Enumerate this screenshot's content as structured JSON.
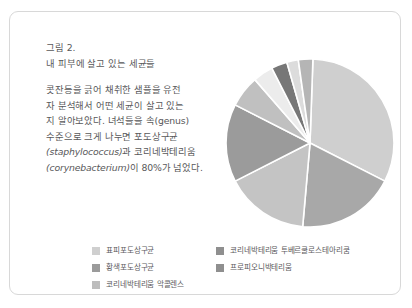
{
  "card": {
    "figure_label": "그림 2.",
    "figure_title": "내 피부에 살고 있는 세균들",
    "paragraph_lines": [
      "콧잔등을 긁어 채취한 샘플을 유전",
      "자 분석해서 어떤 세균이 살고 있는",
      "지 알아보았다. 녀석들을 속(genus)",
      "수준으로 크게 나누면 포도상구균"
    ],
    "paragraph_line5_sci": "(staphylococcus)",
    "paragraph_line5_rest": "과 코리네박테리움",
    "paragraph_line6_sci": "(corynebacterium)",
    "paragraph_line6_rest": "이 80%가 넘었다."
  },
  "chart_data": {
    "type": "pie",
    "title": "내 피부에 살고 있는 세균들",
    "legend_position": "bottom",
    "grid": false,
    "categories": [
      "표피포도상구균",
      "코리네박테리움 투베르쿨로스테아리쿰",
      "황색포도상구균",
      "프로피오니박테리움",
      "코리네박테리움 악콜렌스",
      "기타"
    ],
    "values": [
      32,
      19,
      16,
      15,
      6,
      12
    ],
    "unit": "%",
    "slices": [
      {
        "label": "표피포도상구균",
        "value": 32,
        "color": "#cfcfcf",
        "start_deg": 2,
        "end_deg": 117
      },
      {
        "label": "코리네박테리움 투베르쿨로스테아리쿰",
        "value": 19,
        "color": "#a8a8a8",
        "start_deg": 117,
        "end_deg": 185
      },
      {
        "label": "황색포도상구균",
        "value": 16,
        "color": "#c4c4c4",
        "start_deg": 185,
        "end_deg": 243
      },
      {
        "label": "프로피오니박테리움",
        "value": 15,
        "color": "#9b9b9b",
        "start_deg": 243,
        "end_deg": 297
      },
      {
        "label": "코리네박테리움 악콜렌스",
        "value": 6,
        "color": "#c0c0c0",
        "start_deg": 297,
        "end_deg": 319
      },
      {
        "label": "기타-1",
        "value": 4,
        "color": "#ececec",
        "start_deg": 319,
        "end_deg": 333
      },
      {
        "label": "기타-2",
        "value": 3,
        "color": "#777777",
        "start_deg": 333,
        "end_deg": 344
      },
      {
        "label": "기타-3",
        "value": 2,
        "color": "#dcdcdc",
        "start_deg": 344,
        "end_deg": 352
      },
      {
        "label": "기타-4",
        "value": 3,
        "color": "#b5b5b5",
        "start_deg": 352,
        "end_deg": 362
      }
    ]
  },
  "legend": {
    "left": [
      {
        "label": "표피포도상구균",
        "color": "#cfcfcf"
      },
      {
        "label": "황색포도상구균",
        "color": "#9b9b9b"
      },
      {
        "label": "코리네박테리움 악콜렌스",
        "color": "#bdbdbd"
      }
    ],
    "right": [
      {
        "label": "코리네박테리움 투베르쿨로스테아리쿰",
        "color": "#8f8f8f"
      },
      {
        "label": "프로피오니박테리움",
        "color": "#8f8f8f"
      }
    ]
  },
  "colors": {
    "card_border": "#d8d8d8",
    "text": "#58585a",
    "background": "#ffffff"
  }
}
